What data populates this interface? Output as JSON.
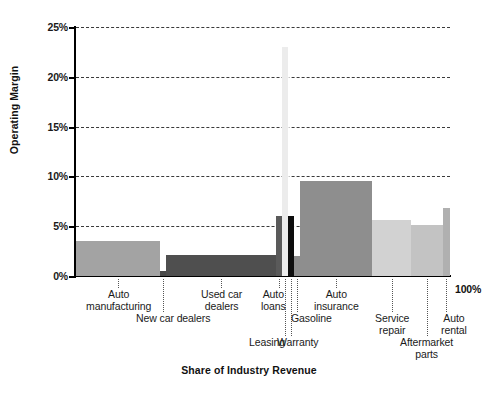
{
  "chart_data": {
    "type": "bar",
    "title": "",
    "xlabel": "Share of Industry Revenue",
    "ylabel": "Operating Margin",
    "ylim": [
      0,
      25
    ],
    "ytick_labels": [
      "0%",
      "5%",
      "10%",
      "15%",
      "20%",
      "25%"
    ],
    "ytick_values": [
      0,
      5,
      10,
      15,
      20,
      25
    ],
    "xlim": [
      0,
      100
    ],
    "x_end_label": "100%",
    "grid": true,
    "legend": "none",
    "note": "Marimekko-style variable-width bar chart: bar width = share of industry revenue (%), bar height = operating margin (%)",
    "categories": [
      "Auto manufacturing",
      "New car dealers",
      "Used car dealers",
      "Auto loans",
      "Leasing",
      "Warranty",
      "Gasoline",
      "Auto insurance",
      "Service repair",
      "Aftermarket parts",
      "Auto rental"
    ],
    "values": [
      3.5,
      0.5,
      2.1,
      6.0,
      23.0,
      6.0,
      2.0,
      9.5,
      5.6,
      5.1,
      6.8
    ],
    "widths": [
      22.5,
      1.6,
      29.4,
      1.6,
      1.6,
      1.6,
      1.6,
      19.3,
      10.4,
      8.4,
      2.0
    ],
    "bar_colors": [
      "#a3a3a3",
      "#4a4a4a",
      "#4f4f4f",
      "#5a5a5a",
      "#ececec",
      "#0d0d0d",
      "#8c8c8c",
      "#8e8e8e",
      "#d2d2d2",
      "#c3c3c3",
      "#b0b0b0"
    ],
    "labels": [
      {
        "text": "Auto\nmanufacturing",
        "row": 0
      },
      {
        "text": "New car dealers",
        "row": 1
      },
      {
        "text": "Used car\ndealers",
        "row": 0
      },
      {
        "text": "Auto\nloans",
        "row": 0
      },
      {
        "text": "Leasing",
        "row": 2
      },
      {
        "text": "Warranty",
        "row": 3
      },
      {
        "text": "Gasoline",
        "row": 1
      },
      {
        "text": "Auto\ninsurance",
        "row": 0
      },
      {
        "text": "Service\nrepair",
        "row": 1
      },
      {
        "text": "Aftermarket\nparts",
        "row": 2
      },
      {
        "text": "Auto\nrental",
        "row": 1
      }
    ]
  },
  "colors": {
    "axis": "#000000",
    "grid": "#3a3a3a",
    "text": "#1a1a1a",
    "background": "#ffffff"
  }
}
